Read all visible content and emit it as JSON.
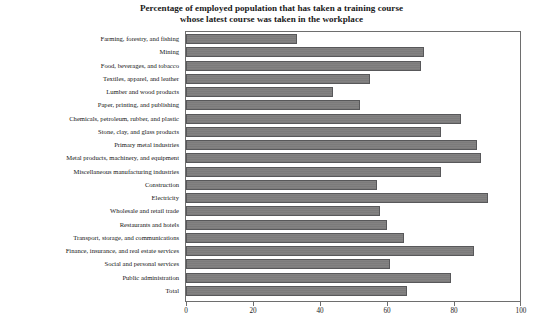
{
  "chart_data": {
    "type": "bar",
    "orientation": "horizontal",
    "title": "Percentage of employed population that has taken a training course whose latest course was taken in the workplace",
    "title_lines": [
      "Percentage of employed population that has taken a training course",
      "whose latest course was taken in the workplace"
    ],
    "xlabel": "",
    "ylabel": "",
    "xlim": [
      0,
      100
    ],
    "xticks": [
      0,
      20,
      40,
      60,
      80,
      100
    ],
    "xticklabels": [
      "0",
      "20",
      "40",
      "60",
      "80",
      "100"
    ],
    "grid": false,
    "legend": false,
    "bar_color": "#7c7b7b",
    "bar_edge_color": "#58585a",
    "frame_color": "#6e6e6e",
    "categories": [
      "Farming, forestry, and fishing",
      "Mining",
      "Food, beverages, and tobacco",
      "Textiles, apparel, and leather",
      "Lumber and wood products",
      "Paper, printing, and publishing",
      "Chemicals, petroleum, rubber, and plastic",
      "Stone, clay, and glass products",
      "Primary metal industries",
      "Metal products, machinery, and equipment",
      "Miscellaneous manufacturing industries",
      "Construction",
      "Electricity",
      "Wholesale and retail trade",
      "Restaurants and hotels",
      "Transport, storage, and communications",
      "Finance, insurance, and real estate services",
      "Social and personal services",
      "Public administration",
      "Total"
    ],
    "values": [
      33,
      71,
      70,
      55,
      44,
      52,
      82,
      76,
      87,
      88,
      76,
      57,
      90,
      58,
      60,
      65,
      86,
      61,
      79,
      66
    ]
  }
}
